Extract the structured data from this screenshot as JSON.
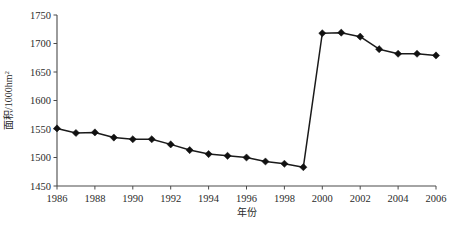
{
  "chart_data": {
    "type": "line",
    "title": "",
    "xlabel": "年份",
    "ylabel": "面积/1000hm",
    "ylabel_superscript": "2",
    "ylabel_full": "面积/1000hm²",
    "xlim": [
      1986,
      2006
    ],
    "ylim": [
      1450,
      1750
    ],
    "yticks": [
      1450,
      1500,
      1550,
      1600,
      1650,
      1700,
      1750
    ],
    "ytick_labels": [
      "1450",
      "1500",
      "1550",
      "1600",
      "1650",
      "1700",
      "1750"
    ],
    "xticks": [
      1986,
      1988,
      1990,
      1992,
      1994,
      1996,
      1998,
      2000,
      2002,
      2004,
      2006
    ],
    "xtick_labels": [
      "1986",
      "1988",
      "1990",
      "1992",
      "1994",
      "1996",
      "1998",
      "2000",
      "2002",
      "2004",
      "2006"
    ],
    "grid": false,
    "legend": false,
    "marker": "diamond",
    "line_color": "#1a1a1a",
    "marker_color": "#111111",
    "x": [
      1986,
      1987,
      1988,
      1989,
      1990,
      1991,
      1992,
      1993,
      1994,
      1995,
      1996,
      1997,
      1998,
      1999,
      2000,
      2001,
      2002,
      2003,
      2004,
      2005,
      2006
    ],
    "values": [
      1551,
      1543,
      1544,
      1535,
      1532,
      1532,
      1523,
      1513,
      1506,
      1503,
      1500,
      1493,
      1489,
      1483,
      1718,
      1719,
      1712,
      1690,
      1682,
      1682,
      1679
    ],
    "series": [
      {
        "name": "面积",
        "values": [
          1551,
          1543,
          1544,
          1535,
          1532,
          1532,
          1523,
          1513,
          1506,
          1503,
          1500,
          1493,
          1489,
          1483,
          1718,
          1719,
          1712,
          1690,
          1682,
          1682,
          1679
        ]
      }
    ]
  }
}
